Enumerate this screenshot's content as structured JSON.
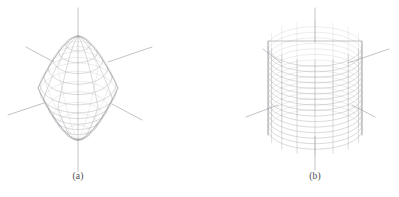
{
  "figure": {
    "background_color": "#ffffff",
    "width": 399,
    "height": 197,
    "panels": [
      {
        "id": "panel-a",
        "caption": "(a)",
        "caption_x": 78,
        "caption_y": 178,
        "object": "bipyramid-wireframe",
        "object_label": "spindle bipyramid wireframe mesh",
        "center_x": 78,
        "center_y": 88,
        "radius_x": 40,
        "radius_y": 52,
        "mesh": {
          "type": "latitude-longitude",
          "longitude_count": 12,
          "latitude_count": 13,
          "line_color": "#aaaaae",
          "silhouette_color": "#8d8d95",
          "line_width": 0.45
        },
        "axes": {
          "line_color": "#9a9aa0",
          "line_width": 0.6,
          "items": [
            {
              "name": "axis-up",
              "x1": 78,
              "y1": 36,
              "x2": 78,
              "y2": 8
            },
            {
              "name": "axis-down",
              "x1": 78,
              "y1": 140,
              "x2": 78,
              "y2": 172
            },
            {
              "name": "axis-upper-left",
              "x1": 52,
              "y1": 61,
              "x2": 26,
              "y2": 47
            },
            {
              "name": "axis-upper-right",
              "x1": 108,
              "y1": 62,
              "x2": 152,
              "y2": 47
            },
            {
              "name": "axis-lower-left",
              "x1": 44,
              "y1": 103,
              "x2": 8,
              "y2": 115
            },
            {
              "name": "axis-lower-right",
              "x1": 112,
              "y1": 104,
              "x2": 142,
              "y2": 120
            }
          ]
        }
      },
      {
        "id": "panel-b",
        "caption": "(b)",
        "caption_x": 315,
        "caption_y": 178,
        "object": "sphere-wireframe",
        "object_label": "sphere wireframe mesh",
        "center_x": 315,
        "center_y": 88,
        "radius_x": 47,
        "radius_y": 47,
        "mesh": {
          "type": "latitude-longitude",
          "longitude_count": 16,
          "latitude_count": 17,
          "line_color": "#aaaaae",
          "silhouette_color": "#8d8d95",
          "line_width": 0.45
        },
        "axes": {
          "line_color": "#9a9aa0",
          "line_width": 0.6,
          "items": [
            {
              "name": "axis-up",
              "x1": 315,
              "y1": 42,
              "x2": 315,
              "y2": 8
            },
            {
              "name": "axis-down",
              "x1": 315,
              "y1": 136,
              "x2": 315,
              "y2": 170
            },
            {
              "name": "axis-upper-left",
              "x1": 281,
              "y1": 63,
              "x2": 263,
              "y2": 49
            },
            {
              "name": "axis-upper-right",
              "x1": 348,
              "y1": 63,
              "x2": 389,
              "y2": 49
            },
            {
              "name": "axis-lower-left",
              "x1": 278,
              "y1": 105,
              "x2": 246,
              "y2": 117
            },
            {
              "name": "axis-lower-right",
              "x1": 352,
              "y1": 105,
              "x2": 375,
              "y2": 117
            }
          ]
        }
      }
    ]
  }
}
